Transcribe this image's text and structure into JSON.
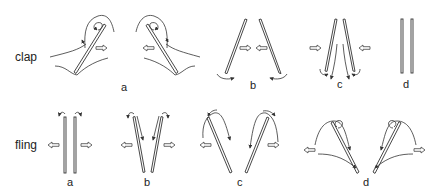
{
  "rows": [
    {
      "label": "clap",
      "panels": [
        {
          "id": "a",
          "label": "a"
        },
        {
          "id": "b",
          "label": "b"
        },
        {
          "id": "c",
          "label": "c"
        },
        {
          "id": "d",
          "label": "d"
        }
      ]
    },
    {
      "label": "fling",
      "panels": [
        {
          "id": "a",
          "label": "a"
        },
        {
          "id": "b",
          "label": "b"
        },
        {
          "id": "c",
          "label": "c"
        },
        {
          "id": "d",
          "label": "d"
        }
      ]
    }
  ],
  "colors": {
    "stroke": "#333333",
    "background": "#ffffff"
  }
}
